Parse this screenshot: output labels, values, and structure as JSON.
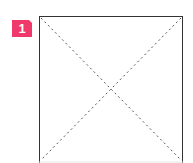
{
  "badge": {
    "label": "1",
    "color": "#f0386b"
  },
  "placeholder": {
    "type": "image-placeholder",
    "icon": "crossed-box-icon",
    "border_color": "#333333",
    "diagonal_color": "#555555"
  }
}
